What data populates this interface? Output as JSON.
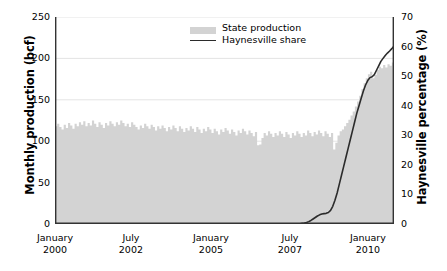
{
  "chart_data": {
    "type": "area",
    "title": "",
    "xlabel": "",
    "ylabel": "Monthly production (bcf)",
    "y2label": "Haynesville percentage (%)",
    "grid": true,
    "legend_position": "top-center",
    "ylim": [
      0,
      250
    ],
    "y2lim": [
      0,
      70
    ],
    "yticks": [
      "0",
      "50",
      "100",
      "150",
      "200",
      "250"
    ],
    "y2ticks": [
      "0",
      "10",
      "20",
      "30",
      "40",
      "50",
      "60",
      "70"
    ],
    "xticks": [
      {
        "month": "January",
        "year": "2000"
      },
      {
        "month": "July",
        "year": "2002"
      },
      {
        "month": "January",
        "year": "2005"
      },
      {
        "month": "July",
        "year": "2007"
      },
      {
        "month": "January",
        "year": "2010"
      }
    ],
    "xtick_positions_pct": [
      0,
      22.4,
      46.0,
      69.3,
      92.3
    ],
    "series": [
      {
        "name": "State production",
        "type": "area",
        "axis": "left",
        "color": "#d3d3d3",
        "units": "bcf",
        "values": [
          118,
          121,
          117,
          114,
          120,
          116,
          122,
          119,
          115,
          121,
          118,
          123,
          120,
          124,
          118,
          122,
          119,
          125,
          121,
          117,
          123,
          120,
          116,
          122,
          119,
          124,
          121,
          118,
          123,
          120,
          125,
          122,
          118,
          121,
          117,
          123,
          120,
          117,
          114,
          119,
          116,
          121,
          118,
          115,
          120,
          117,
          113,
          118,
          115,
          119,
          116,
          112,
          117,
          114,
          119,
          116,
          112,
          118,
          115,
          111,
          116,
          113,
          118,
          115,
          111,
          117,
          114,
          110,
          115,
          112,
          117,
          114,
          110,
          115,
          112,
          108,
          114,
          111,
          116,
          113,
          109,
          114,
          111,
          107,
          113,
          110,
          115,
          112,
          108,
          113,
          110,
          106,
          111,
          95,
          96,
          104,
          110,
          107,
          112,
          109,
          105,
          110,
          107,
          112,
          109,
          105,
          111,
          108,
          104,
          110,
          107,
          112,
          109,
          105,
          110,
          107,
          113,
          110,
          106,
          111,
          108,
          113,
          110,
          106,
          112,
          109,
          105,
          110,
          90,
          98,
          107,
          112,
          114,
          118,
          122,
          126,
          131,
          136,
          142,
          148,
          155,
          163,
          170,
          176,
          181,
          184,
          176,
          180,
          186,
          190,
          188,
          192,
          189,
          193,
          191,
          195
        ]
      },
      {
        "name": "Haynesville share",
        "type": "line",
        "axis": "right",
        "color": "#2b2b2b",
        "units": "%",
        "values": [
          0,
          0,
          0,
          0,
          0,
          0,
          0,
          0,
          0,
          0,
          0,
          0,
          0,
          0,
          0,
          0,
          0,
          0,
          0,
          0,
          0,
          0,
          0,
          0,
          0,
          0,
          0,
          0,
          0,
          0,
          0,
          0,
          0,
          0,
          0,
          0,
          0,
          0,
          0,
          0,
          0,
          0,
          0,
          0,
          0,
          0,
          0,
          0,
          0,
          0,
          0,
          0,
          0,
          0,
          0,
          0,
          0,
          0,
          0,
          0,
          0,
          0,
          0,
          0,
          0,
          0,
          0,
          0,
          0,
          0,
          0,
          0,
          0,
          0,
          0,
          0,
          0,
          0,
          0,
          0,
          0,
          0,
          0,
          0,
          0,
          0,
          0,
          0,
          0,
          0,
          0,
          0,
          0,
          0,
          0,
          0,
          0,
          0,
          0,
          0,
          0,
          0,
          0,
          0,
          0,
          0,
          0,
          0,
          0,
          0,
          0,
          0,
          0.1,
          0.2,
          0.3,
          0.5,
          0.8,
          1.2,
          1.7,
          2.2,
          2.7,
          3.1,
          3.4,
          3.5,
          3.6,
          3.9,
          4.6,
          6.0,
          8.0,
          10.5,
          13.5,
          16.5,
          19.5,
          22.5,
          25.5,
          28.5,
          31.5,
          34.5,
          37.5,
          40.0,
          42.5,
          45.0,
          47.0,
          48.5,
          49.5,
          49.8,
          50.5,
          52.0,
          53.5,
          55.0,
          56.0,
          57.0,
          57.8,
          58.5,
          59.3,
          60.2
        ]
      }
    ],
    "legend": [
      {
        "label": "State production",
        "marker": "area-swatch"
      },
      {
        "label": "Haynesville share",
        "marker": "line"
      }
    ],
    "notes": {
      "n_points": 156,
      "x_start": "January 2000",
      "x_end": "December 2012"
    }
  }
}
